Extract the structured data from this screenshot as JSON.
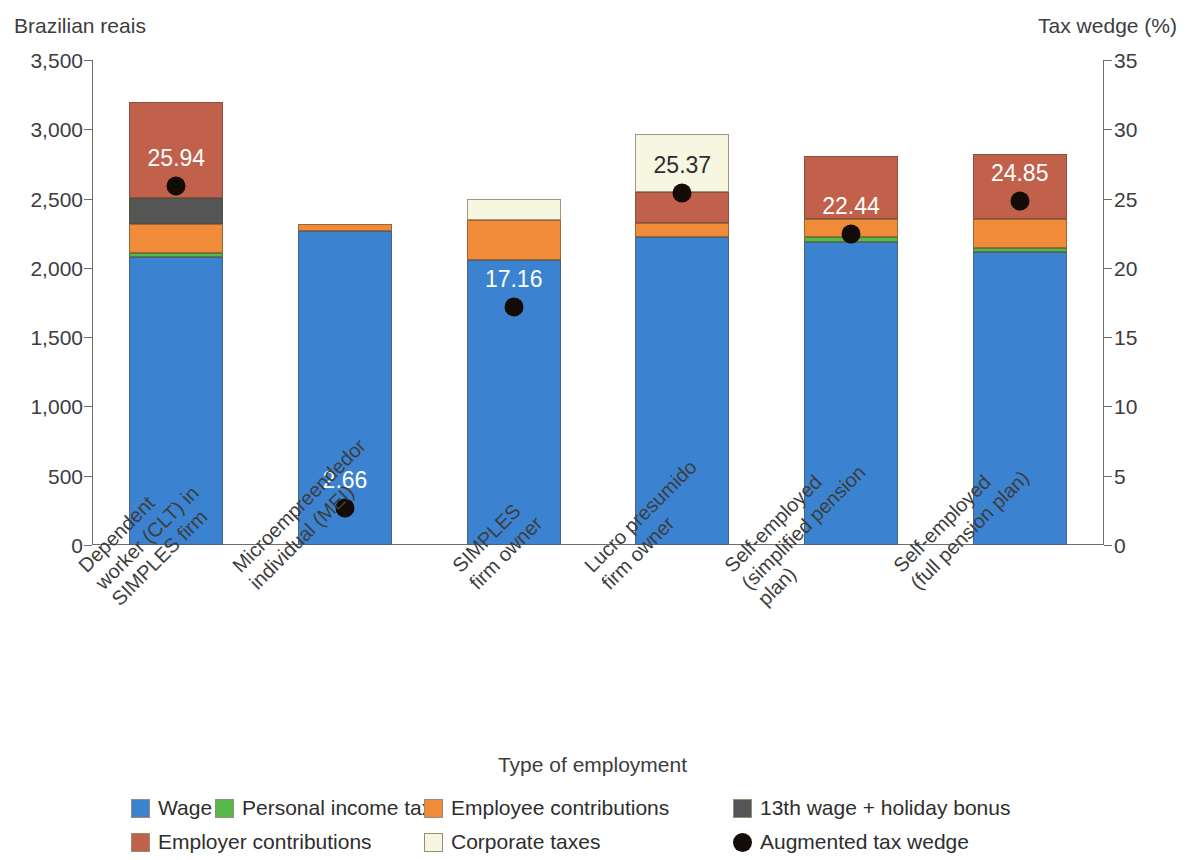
{
  "left_axis_title": "Brazilian reais",
  "right_axis_title": "Tax wedge (%)",
  "x_axis_title": "Type of employment",
  "legend": {
    "row1": [
      {
        "label": "Wage",
        "color": "#3B83D0",
        "shape": "square"
      },
      {
        "label": "Personal income tax",
        "color": "#55B848",
        "shape": "square"
      },
      {
        "label": "Employee contributions",
        "color": "#F08B3A",
        "shape": "square"
      },
      {
        "label": "13th wage + holiday bonus",
        "color": "#555555",
        "shape": "square"
      }
    ],
    "row2": [
      {
        "label": "Employer contributions",
        "color": "#C1614B",
        "shape": "square"
      },
      {
        "label": "Corporate taxes",
        "color": "#F7F6E0",
        "shape": "square"
      },
      {
        "label": "Augmented tax wedge",
        "color": "#140A06",
        "shape": "circle"
      }
    ]
  },
  "chart_data": {
    "type": "bar",
    "title": "",
    "xlabel": "Type of employment",
    "ylabel": "Brazilian reais",
    "y2label": "Tax wedge (%)",
    "grid": false,
    "legend_position": "bottom",
    "ylim": [
      0,
      3500
    ],
    "y2lim": [
      0,
      35
    ],
    "yticks": [
      "0",
      "500",
      "1,000",
      "1,500",
      "2,000",
      "2,500",
      "3,000",
      "3,500"
    ],
    "ytick_values": [
      0,
      500,
      1000,
      1500,
      2000,
      2500,
      3000,
      3500
    ],
    "y2ticks": [
      "0",
      "5",
      "10",
      "15",
      "20",
      "25",
      "30",
      "35"
    ],
    "y2tick_values": [
      0,
      5,
      10,
      15,
      20,
      25,
      30,
      35
    ],
    "categories": [
      "Dependent\nworker (CLT) in\nSIMPLES firm",
      "Microempreendedor\nindividual (MEI)",
      "SIMPLES\nfirm owner",
      "Lucro presumido\nfirm owner",
      "Self-employed\n(simplified pension\nplan)",
      "Self-employed\n(full pension plan)"
    ],
    "category_lines": [
      [
        "Dependent",
        "worker (CLT) in",
        "SIMPLES firm"
      ],
      [
        "Microempreendedor",
        "individual (MEI)"
      ],
      [
        "SIMPLES",
        "firm owner"
      ],
      [
        "Lucro presumido",
        "firm owner"
      ],
      [
        "Self-employed",
        "(simplified pension",
        "plan)"
      ],
      [
        "Self-employed",
        "(full pension plan)"
      ]
    ],
    "stack_order": [
      "Wage",
      "Personal income tax",
      "Employee contributions",
      "13th wage + holiday bonus",
      "Employer contributions",
      "Corporate taxes"
    ],
    "series": [
      {
        "name": "Wage",
        "color": "#3B83D0",
        "values": [
          2075,
          2265,
          2055,
          2220,
          2190,
          2115
        ]
      },
      {
        "name": "Personal income tax",
        "color": "#55B848",
        "values": [
          30,
          0,
          0,
          0,
          30,
          30
        ]
      },
      {
        "name": "Employee contributions",
        "color": "#F08B3A",
        "values": [
          215,
          55,
          290,
          105,
          135,
          205
        ]
      },
      {
        "name": "13th wage + holiday bonus",
        "color": "#555555",
        "values": [
          185,
          0,
          0,
          0,
          0,
          0
        ]
      },
      {
        "name": "Employer contributions",
        "color": "#C1614B",
        "values": [
          690,
          0,
          0,
          220,
          450,
          475
        ]
      },
      {
        "name": "Corporate taxes",
        "color": "#F7F6E0",
        "values": [
          0,
          0,
          155,
          420,
          0,
          0
        ]
      }
    ],
    "totals": [
      3195,
      2320,
      2500,
      2965,
      2805,
      2825
    ],
    "tax_wedge": {
      "name": "Augmented tax wedge",
      "color": "#140A06",
      "values": [
        25.94,
        17.16,
        2.66,
        25.37,
        22.44,
        24.85
      ],
      "labels": [
        "25.94",
        "2.66",
        "17.16",
        "25.37",
        "22.44",
        "24.85"
      ],
      "points": [
        {
          "category_index": 0,
          "value": 25.94,
          "label": "25.94",
          "label_color": "#ffffff"
        },
        {
          "category_index": 1,
          "value": 2.66,
          "label": "2.66",
          "label_color": "#ffffff"
        },
        {
          "category_index": 2,
          "value": 17.16,
          "label": "17.16",
          "label_color": "#ffffff"
        },
        {
          "category_index": 3,
          "value": 25.37,
          "label": "25.37",
          "label_color": "#2e2e2e"
        },
        {
          "category_index": 4,
          "value": 22.44,
          "label": "22.44",
          "label_color": "#ffffff"
        },
        {
          "category_index": 5,
          "value": 24.85,
          "label": "24.85",
          "label_color": "#ffffff"
        }
      ]
    }
  }
}
